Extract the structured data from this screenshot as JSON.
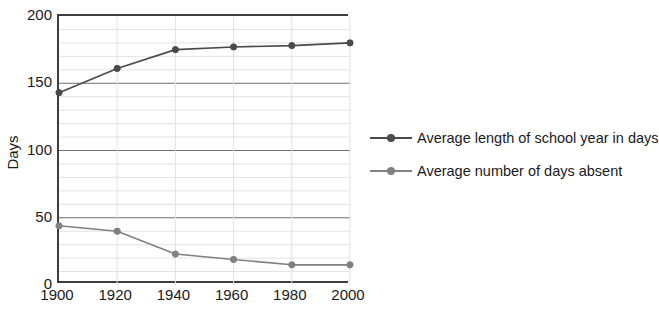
{
  "chart_data": {
    "type": "line",
    "title": "",
    "xlabel": "",
    "ylabel": "Days",
    "x": [
      1900,
      1920,
      1940,
      1960,
      1980,
      2000
    ],
    "xticklabels": [
      "1900",
      "1920",
      "1940",
      "1960",
      "1980",
      "2000"
    ],
    "xlim": [
      1900,
      2000
    ],
    "ylim": [
      0,
      200
    ],
    "yticks": [
      0,
      50,
      100,
      150,
      200
    ],
    "yticklabels": [
      "0",
      "50",
      "100",
      "150",
      "200"
    ],
    "minor_y_step": 10,
    "grid": true,
    "legend_position": "right",
    "series": [
      {
        "name": "Average length of school year in days",
        "color": "#4a4a4a",
        "values": [
          143,
          161,
          175,
          177,
          178,
          180
        ]
      },
      {
        "name": "Average number of days absent",
        "color": "#808080",
        "values": [
          44,
          40,
          23,
          19,
          15,
          15
        ]
      }
    ]
  },
  "legend": {
    "items": [
      {
        "label": "Average length of school year in days"
      },
      {
        "label": "Average number of days absent"
      }
    ]
  },
  "colors": {
    "series_1": "#4a4a4a",
    "series_2": "#808080",
    "axis": "#3d3d3d",
    "major_grid": "#6e6e6e",
    "minor_grid": "#e2e2e2",
    "text": "#1a1a1a",
    "background": "#ffffff"
  }
}
